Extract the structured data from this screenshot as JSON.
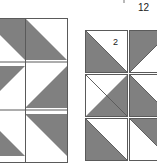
{
  "figure": {
    "title_label": "12",
    "palette": {
      "shade_fill": "#808080",
      "light_fill": "#ffffff",
      "outline": "#5a5a5a",
      "background": "#ffffff",
      "text": "#1a1a1a"
    }
  },
  "assembled_block": {
    "name": "pinwheel-quilt-block",
    "x": -17,
    "y": 18,
    "width": 85,
    "height": 145,
    "grid_cols": 2,
    "grid_rows": 3,
    "cell": 42,
    "cells": [
      {
        "row": 0,
        "col": 0,
        "shade_corner": "top-right"
      },
      {
        "row": 0,
        "col": 1,
        "shade_corner": "bottom-left"
      },
      {
        "row": 1,
        "col": 0,
        "shade_corner": "top-left"
      },
      {
        "row": 1,
        "col": 1,
        "shade_corner": "bottom-right"
      },
      {
        "row": 2,
        "col": 0,
        "shade_corner": "bottom-left"
      },
      {
        "row": 2,
        "col": 1,
        "shade_corner": "top-right"
      }
    ]
  },
  "exploded_units": {
    "name": "half-square-triangle-units",
    "origin_x": 85,
    "origin_y": 30,
    "unit_size": 43,
    "gap": 1,
    "units": [
      {
        "id": "u-r0-c0",
        "row": 0,
        "col": 0,
        "shade_corner": "bottom-left",
        "label": "2"
      },
      {
        "id": "u-r0-c1",
        "row": 0,
        "col": 1,
        "shade_corner": "top-left",
        "label": ""
      },
      {
        "id": "u-r1-c0",
        "row": 1,
        "col": 0,
        "shade_corner": "bottom-right",
        "label": ""
      },
      {
        "id": "u-r1-c1",
        "row": 1,
        "col": 1,
        "shade_corner": "bottom-left",
        "label": ""
      },
      {
        "id": "u-r2-c0",
        "row": 2,
        "col": 0,
        "shade_corner": "bottom-left",
        "label": ""
      },
      {
        "id": "u-r2-c1",
        "row": 2,
        "col": 1,
        "shade_corner": "top-right",
        "label": ""
      }
    ]
  },
  "labels": {
    "top_count": "12",
    "unit_count": "2"
  }
}
